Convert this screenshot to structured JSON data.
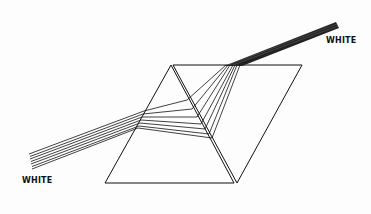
{
  "diagram": {
    "type": "prism-dispersion-recombination",
    "labels": {
      "input_beam": "WHITE",
      "output_beam": "WHITE"
    },
    "colors": {
      "line": "#111111",
      "background": "#fdfdfd"
    },
    "ray_count": 7
  }
}
